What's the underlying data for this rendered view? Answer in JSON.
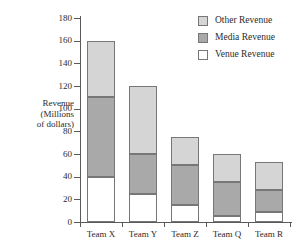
{
  "chart_data": {
    "type": "bar",
    "barmode": "stacked",
    "title": "",
    "xlabel": "",
    "ylabel": "Revenue (Millions of dollars)",
    "ylabel_lines": [
      "Revenue",
      "(Millions",
      "of dollars)"
    ],
    "categories": [
      "Team X",
      "Team Y",
      "Team Z",
      "Team Q",
      "Team R"
    ],
    "series": [
      {
        "name": "Venue Revenue",
        "values": [
          40,
          25,
          15,
          5,
          9
        ],
        "color": "#ffffff"
      },
      {
        "name": "Media Revenue",
        "values": [
          70,
          35,
          35,
          30,
          19
        ],
        "color": "#a9a9a9"
      },
      {
        "name": "Other Revenue",
        "values": [
          50,
          60,
          25,
          25,
          25
        ],
        "color": "#d5d5d5"
      }
    ],
    "stack_order_bottom_to_top": [
      "Venue Revenue",
      "Media Revenue",
      "Other Revenue"
    ],
    "cumulative_tops": {
      "Team X": {
        "venue": 40,
        "media": 110,
        "other": 160
      },
      "Team Y": {
        "venue": 25,
        "media": 60,
        "other": 120
      },
      "Team Z": {
        "venue": 15,
        "media": 50,
        "other": 75
      },
      "Team Q": {
        "venue": 5,
        "media": 35,
        "other": 60
      },
      "Team R": {
        "venue": 9,
        "media": 28,
        "other": 53
      }
    },
    "totals": [
      160,
      120,
      75,
      60,
      53
    ],
    "ylim": [
      0,
      180
    ],
    "yticks": [
      0,
      20,
      40,
      60,
      80,
      100,
      120,
      140,
      160,
      180
    ],
    "ytick_labels": [
      "0",
      "20",
      "40",
      "60",
      "80",
      "100",
      "120",
      "140",
      "160",
      "180"
    ],
    "grid": false,
    "legend_position": "top-right",
    "legend": [
      {
        "label": "Other Revenue",
        "color": "#d5d5d5"
      },
      {
        "label": "Media Revenue",
        "color": "#a9a9a9"
      },
      {
        "label": "Venue Revenue",
        "color": "#ffffff"
      }
    ]
  }
}
